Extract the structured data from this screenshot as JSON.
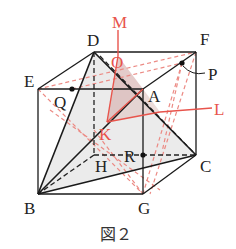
{
  "figure": {
    "caption": "図２",
    "colors": {
      "edge": "#1a1a1a",
      "red": "#e8544c",
      "red_dashed": "#ec8a84",
      "shade": "#e6e6e6",
      "shade_red": "#d9b5b3"
    },
    "labels": {
      "D": "D",
      "E": "E",
      "F": "F",
      "A": "A",
      "B": "B",
      "C": "C",
      "G": "G",
      "H": "H",
      "Q": "Q",
      "P": "P",
      "R": "R",
      "M": "M",
      "O": "O",
      "K": "K",
      "L": "L"
    },
    "points": {
      "D": [
        94,
        52
      ],
      "F": [
        196,
        52
      ],
      "E": [
        38,
        89
      ],
      "A": [
        143,
        89
      ],
      "B": [
        38,
        194
      ],
      "G": [
        143,
        194
      ],
      "H": [
        94,
        155
      ],
      "C": [
        196,
        155
      ],
      "Q": [
        72,
        89
      ],
      "P": [
        182,
        63
      ],
      "R": [
        143,
        155
      ],
      "O": [
        118,
        56
      ],
      "K": [
        107,
        122
      ]
    }
  }
}
